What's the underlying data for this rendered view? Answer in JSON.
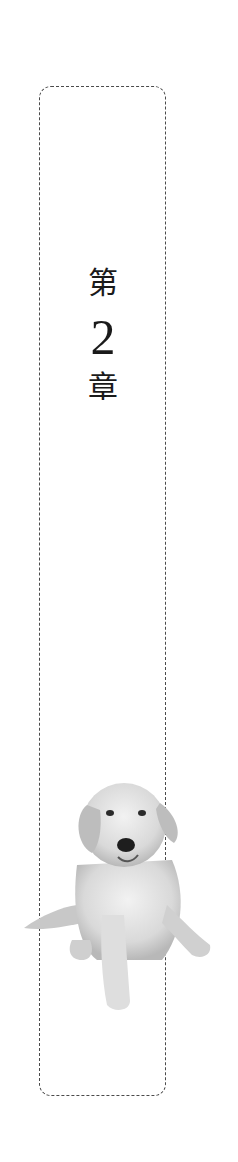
{
  "chapter": {
    "prefix": "第",
    "number": "2",
    "suffix": "章"
  },
  "illustration": {
    "subject": "puppy-photo",
    "style": "grayscale"
  },
  "colors": {
    "border": "#4a4a4a",
    "text": "#1a1a1a",
    "background": "#ffffff"
  }
}
